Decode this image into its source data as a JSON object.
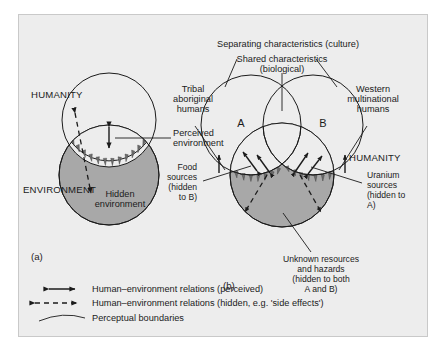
{
  "figure": {
    "background_color": "#ededed",
    "border_color": "#c9c9c9",
    "environment_fill": "#a8a8a8",
    "line_color": "#1b1b1b",
    "panels": [
      {
        "id": "panel-a",
        "label": "(a)",
        "labels": {
          "humanity": "HUMANITY",
          "environment": "ENVIRONMENT",
          "perceived_environment": "Perceived\nenvironment",
          "perceived_environment_line1": "Perceived",
          "perceived_environment_line2": "environment",
          "hidden_environment_line1": "Hidden",
          "hidden_environment_line2": "environment"
        }
      },
      {
        "id": "panel-b",
        "label": "(b)",
        "labels": {
          "separating": "Separating characteristics (culture)",
          "shared_line1": "Shared characteristics",
          "shared_line2": "(biological)",
          "tribal_line1": "Tribal",
          "tribal_line2": "aboriginal",
          "tribal_line3": "humans",
          "western_line1": "Western",
          "western_line2": "multinational",
          "western_line3": "humans",
          "set_a": "A",
          "set_b": "B",
          "humanity": "HUMANITY",
          "food_line1": "Food",
          "food_line2": "sources",
          "food_line3": "(hidden",
          "food_line4": "to B)",
          "uranium_line1": "Uranium",
          "uranium_line2": "sources",
          "uranium_line3": "(hidden to",
          "uranium_line4": "A)",
          "unknown_line1": "Unknown resources",
          "unknown_line2": "and hazards",
          "unknown_line3": "(hidden to both",
          "unknown_line4": "A and B)"
        }
      }
    ],
    "legend": {
      "items": [
        {
          "symbol": "double-headed-arrow-solid",
          "text": "Human–environment relations (perceived)"
        },
        {
          "symbol": "double-headed-arrow-dashed",
          "text": "Human–environment relations (hidden, e.g. 'side effects')"
        },
        {
          "symbol": "arc-curve",
          "text": "Perceptual boundaries"
        }
      ]
    }
  }
}
